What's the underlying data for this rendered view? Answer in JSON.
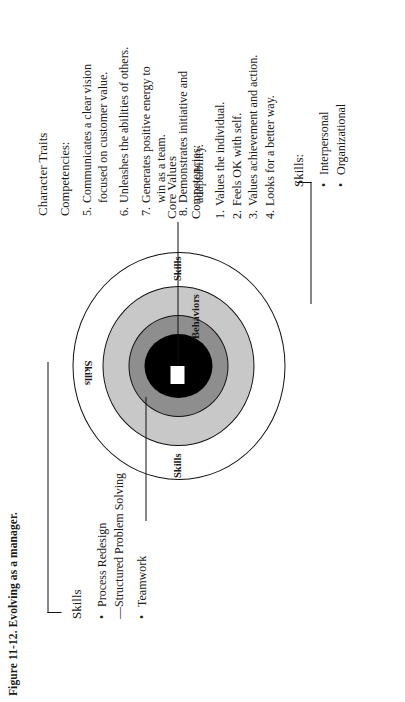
{
  "figure": {
    "caption": "Figure 11-12.  Evolving as a manager."
  },
  "diagram": {
    "ring_labels": {
      "skills_top": "Skills",
      "skills_left": "Skills",
      "skills_right": "Skills",
      "behaviors": "Behaviors"
    }
  },
  "blocks": {
    "character_traits": {
      "title": "Character Traits",
      "subtitle": "Competencies:",
      "items": [
        {
          "num": "5.",
          "line1": "Communicates a clear vision",
          "line2": "focused on customer value."
        },
        {
          "num": "6.",
          "line1": "Unleashes the abilities of others.",
          "line2": ""
        },
        {
          "num": "7.",
          "line1": "Generates positive energy to",
          "line2": "win as a team."
        },
        {
          "num": "8.",
          "line1": "Demonstrates initiative and",
          "line2": "adaptability."
        }
      ]
    },
    "core_values": {
      "title": "Core Values",
      "subtitle": "Competencies:",
      "items": [
        {
          "num": "1.",
          "text": "Values the individual."
        },
        {
          "num": "2.",
          "text": "Feels OK with self."
        },
        {
          "num": "3.",
          "text": "Values achievement and action."
        },
        {
          "num": "4.",
          "text": "Looks for a better way."
        }
      ]
    },
    "skills_left": {
      "title": "Skills",
      "items": [
        {
          "marker": "•",
          "text": "Process Redesign"
        },
        {
          "marker": "—",
          "text": "Structured Problem Solving"
        },
        {
          "marker": "•",
          "text": "Teamwork"
        }
      ]
    },
    "skills_right": {
      "title": "Skills:",
      "items": [
        {
          "marker": "•",
          "text": "Interpersonal"
        },
        {
          "marker": "•",
          "text": "Organizational"
        }
      ]
    }
  },
  "colors": {
    "outer_ring": "#ffffff",
    "mid_ring": "#c8c8c8",
    "inner_ring": "#8e8e8e",
    "core": "#000000",
    "stroke": "#111111"
  }
}
